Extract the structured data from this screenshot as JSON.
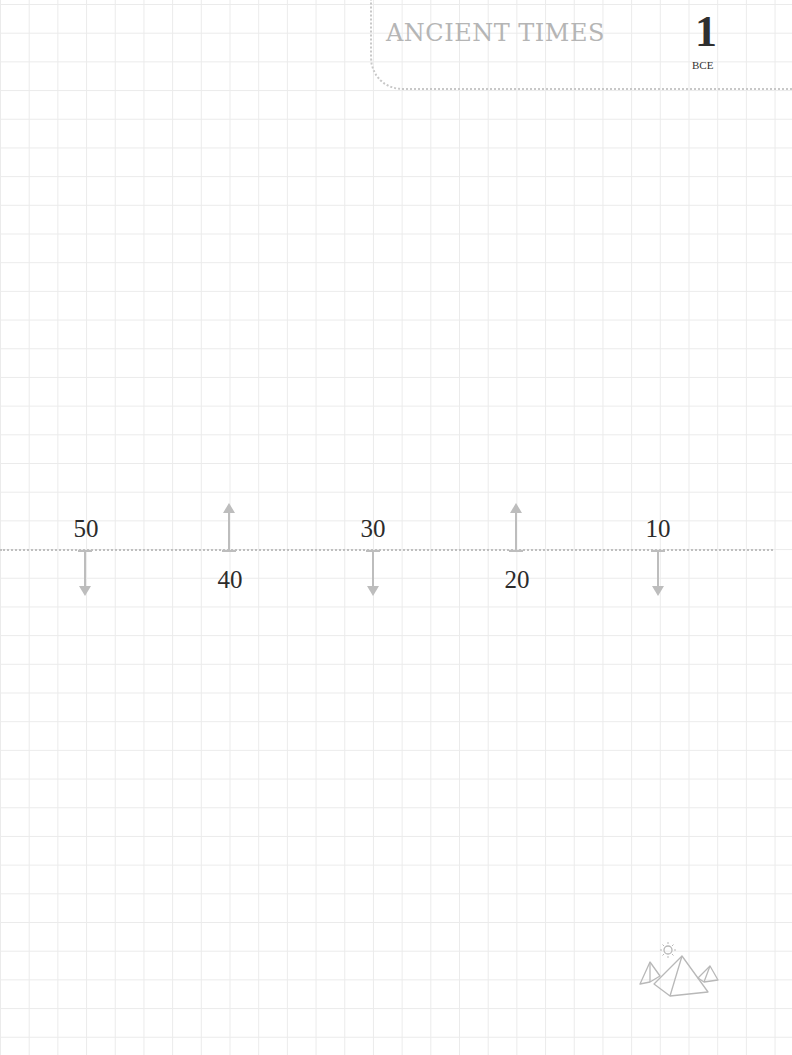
{
  "header": {
    "title": "ANCIENT TIMES",
    "page_number": "1",
    "era": "BCE"
  },
  "timeline": {
    "marks": [
      {
        "label": "50",
        "direction": "down",
        "x": 85
      },
      {
        "label": "40",
        "direction": "up",
        "x": 229
      },
      {
        "label": "30",
        "direction": "down",
        "x": 373
      },
      {
        "label": "20",
        "direction": "up",
        "x": 516
      },
      {
        "label": "10",
        "direction": "down",
        "x": 658
      }
    ]
  },
  "decoration": {
    "icon": "pyramids-with-sun-icon"
  },
  "colors": {
    "grid": "#ebebeb",
    "dotted_line": "#bfbfbf",
    "arrow": "#bdbdbd",
    "title": "#b5b5b5",
    "text": "#2b2b2b"
  }
}
